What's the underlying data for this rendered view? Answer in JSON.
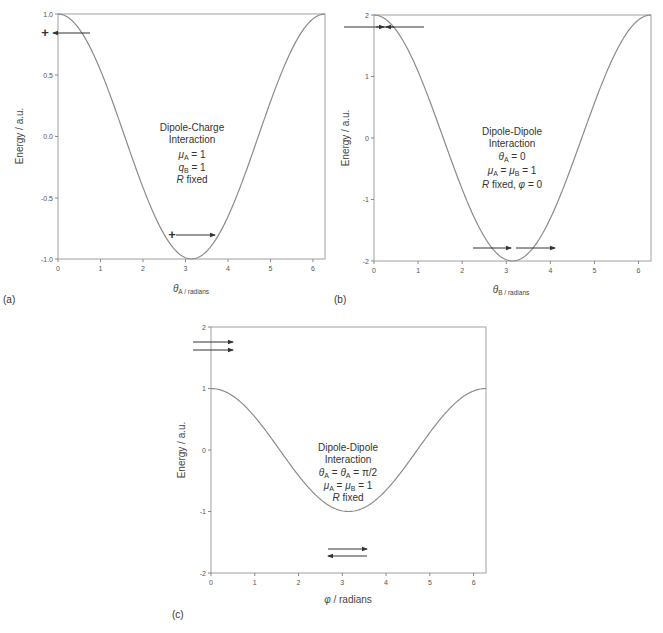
{
  "chart_data": [
    {
      "type": "line",
      "panel": "(a)",
      "title": "",
      "xlabel": "θA / radians",
      "ylabel": "Energy / a.u.",
      "xlim": [
        0,
        6.2832
      ],
      "ylim": [
        -1.0,
        1.0
      ],
      "xticks": [
        0,
        1,
        2,
        3,
        4,
        5,
        6
      ],
      "yticks": [
        -1.0,
        -0.5,
        0.0,
        0.5,
        1.0
      ],
      "ytick_labels": [
        "-1.0",
        "-0.5",
        "0.0",
        "0.5",
        "1.0"
      ],
      "grid": false,
      "series": [
        {
          "name": "E = cos(θA)",
          "function": "cos(x)",
          "x": [
            0,
            0.5,
            1.0,
            1.5,
            2.0,
            2.5,
            3.0,
            3.1416,
            3.5,
            4.0,
            4.5,
            5.0,
            5.5,
            6.0,
            6.2832
          ],
          "values": [
            1.0,
            0.88,
            0.54,
            0.07,
            -0.42,
            -0.8,
            -0.99,
            -1.0,
            -0.94,
            -0.65,
            -0.21,
            0.28,
            0.71,
            0.96,
            1.0
          ]
        }
      ],
      "annotation": [
        "Dipole-Charge",
        "Interaction",
        "μA =  1",
        "qB = 1",
        "R fixed"
      ]
    },
    {
      "type": "line",
      "panel": "(b)",
      "title": "",
      "xlabel": "θB / radians",
      "ylabel": "Energy / a.u.",
      "xlim": [
        0,
        6.2832
      ],
      "ylim": [
        -2,
        2
      ],
      "xticks": [
        0,
        1,
        2,
        3,
        4,
        5,
        6
      ],
      "yticks": [
        -2,
        -1,
        0,
        1,
        2
      ],
      "ytick_labels": [
        "-2",
        "-1",
        "0",
        "1",
        "2"
      ],
      "grid": false,
      "series": [
        {
          "name": "E = 2cos(θB)",
          "function": "2cos(x)",
          "x": [
            0,
            0.5,
            1.0,
            1.5,
            2.0,
            2.5,
            3.0,
            3.1416,
            3.5,
            4.0,
            4.5,
            5.0,
            5.5,
            6.0,
            6.2832
          ],
          "values": [
            2.0,
            1.76,
            1.08,
            0.14,
            -0.83,
            -1.6,
            -1.98,
            -2.0,
            -1.87,
            -1.31,
            -0.42,
            0.57,
            1.42,
            1.92,
            2.0
          ]
        }
      ],
      "annotation": [
        "Dipole-Dipole",
        "Interaction",
        "θA = 0",
        "μA = μB = 1",
        "R fixed, φ = 0"
      ]
    },
    {
      "type": "line",
      "panel": "(c)",
      "title": "",
      "xlabel": "φ / radians",
      "ylabel": "Energy / a.u.",
      "xlim": [
        0,
        6.2832
      ],
      "ylim": [
        -2,
        2
      ],
      "xticks": [
        0,
        1,
        2,
        3,
        4,
        5,
        6
      ],
      "yticks": [
        -2,
        -1,
        0,
        1,
        2
      ],
      "ytick_labels": [
        "-2",
        "-1",
        "0",
        "1",
        "2"
      ],
      "grid": false,
      "series": [
        {
          "name": "E = cos(φ)",
          "function": "cos(x)",
          "x": [
            0,
            0.5,
            1.0,
            1.5,
            2.0,
            2.5,
            3.0,
            3.1416,
            3.5,
            4.0,
            4.5,
            5.0,
            5.5,
            6.0,
            6.2832
          ],
          "values": [
            1.0,
            0.88,
            0.54,
            0.07,
            -0.42,
            -0.8,
            -0.99,
            -1.0,
            -0.94,
            -0.65,
            -0.21,
            0.28,
            0.71,
            0.96,
            1.0
          ]
        }
      ],
      "annotation": [
        "Dipole-Dipole",
        "Interaction",
        "θA = θA = π/2",
        "μA = μB = 1",
        "R fixed"
      ]
    }
  ],
  "panels": {
    "a": {
      "tag": "(a)",
      "ylabel": "Energy / a.u.",
      "xlabel_sym": "θ",
      "xlabel_sub": "A / radians",
      "yticks": [
        "1.0",
        "0.5",
        "0.0",
        "-0.5",
        "-1.0"
      ],
      "xticks": [
        "0",
        "1",
        "2",
        "3",
        "4",
        "5",
        "6"
      ],
      "annot": {
        "line1": "Dipole-Charge",
        "line2": "Interaction",
        "l3_sym": "μ",
        "l3_sub": "A",
        "l3_rest": " =  1",
        "l4_sym": "q",
        "l4_sub": "B",
        "l4_rest": " = 1",
        "l5_sym": "R",
        "l5_rest": " fixed"
      },
      "plus": "+"
    },
    "b": {
      "tag": "(b)",
      "ylabel": "Energy / a.u.",
      "xlabel_sym": "θ",
      "xlabel_sub": "B / radians",
      "yticks": [
        "2",
        "1",
        "0",
        "-1",
        "-2"
      ],
      "xticks": [
        "0",
        "1",
        "2",
        "3",
        "4",
        "5",
        "6"
      ],
      "annot": {
        "line1": "Dipole-Dipole",
        "line2": "Interaction",
        "l3_sym": "θ",
        "l3_sub": "A",
        "l3_rest": " = 0",
        "l4_sym": "μ",
        "l4_sub": "A",
        "l4_mid": " = ",
        "l4_sym2": "μ",
        "l4_sub2": "B",
        "l4_rest": " = 1",
        "l5_sym": "R",
        "l5_rest": " fixed, ",
        "l5_sym2": "φ",
        "l5_rest2": " = 0"
      }
    },
    "c": {
      "tag": "(c)",
      "ylabel": "Energy / a.u.",
      "xlabel_sym": "φ",
      "xlabel_rest": " / radians",
      "yticks": [
        "2",
        "1",
        "0",
        "-1",
        "-2"
      ],
      "xticks": [
        "0",
        "1",
        "2",
        "3",
        "4",
        "5",
        "6"
      ],
      "annot": {
        "line1": "Dipole-Dipole",
        "line2": "Interaction",
        "l3_sym": "θ",
        "l3_sub": "A",
        "l3_mid": " = ",
        "l3_sym2": "θ",
        "l3_sub2": "A",
        "l3_rest": " = π/2",
        "l4_sym": "μ",
        "l4_sub": "A",
        "l4_mid": " = ",
        "l4_sym2": "μ",
        "l4_sub2": "B",
        "l4_rest": " = 1",
        "l5_sym": "R",
        "l5_rest": " fixed"
      }
    }
  },
  "colors": {
    "curve": "#8a8a8a",
    "axis": "#9a9a9a",
    "arrow": "#333333",
    "text": "#333333"
  }
}
